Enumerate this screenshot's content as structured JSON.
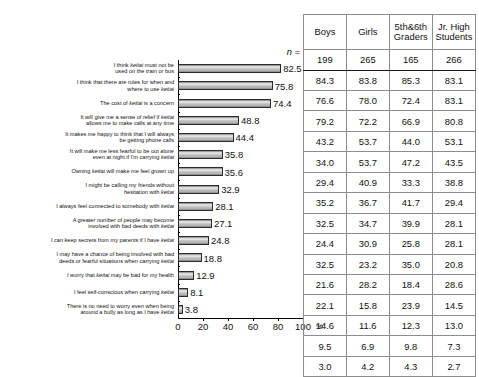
{
  "chart_data": {
    "type": "bar",
    "title": "",
    "xlabel": "",
    "ylabel": "",
    "unit": "%",
    "xlim": [
      0,
      100
    ],
    "xticks": [
      0,
      20,
      40,
      60,
      80,
      100
    ],
    "grid": false,
    "orientation": "horizontal",
    "categories": [
      "I think keitai must not be\nused on the train or bus",
      "I think that there are rules for when and\nwhere to use keitai",
      "The cost of keitai is a concern",
      "It will give me a sense of relief if keitai\nallows me to make calls at any time",
      "It makes me happy to think that I will always\nbe getting phone calls",
      "It will make me less fearful to be out alone\neven at night if  I'm carrying keitai",
      "Owning keitai will make me feel grown up",
      "I might be calling my friends without\nhesitation with keitai",
      "I always feel connected to somebody with keitai",
      "A greater number of people may become\ninvolved with bad deeds with keitai",
      "I can keep secrets from my parents if I have keitai",
      "I may have a chance of being involved with bad\ndeeds or fearful situations when carrying keitai",
      "I worry that keitai may be bad for my health",
      "I feel self-conscious when carrying keitai",
      "There is no need to worry even when being\naround a bully as long as I have keitai"
    ],
    "values": [
      82.5,
      75.8,
      74.4,
      48.8,
      44.4,
      35.8,
      35.6,
      32.9,
      28.1,
      27.1,
      24.8,
      18.8,
      12.9,
      8.1,
      3.8
    ],
    "value_labels": [
      "82.5",
      "75.8",
      "74.4",
      "48.8",
      "44.4",
      "35.8",
      "35.6",
      "32.9",
      "28.1",
      "27.1",
      "24.8",
      "18.8",
      "12.9",
      "8.1",
      "3.8"
    ],
    "tick_labels": [
      "0",
      "20",
      "40",
      "60",
      "80",
      "100"
    ]
  },
  "table": {
    "n_label": "n =",
    "columns": [
      "Boys",
      "Girls",
      "5th&6th Graders",
      "Jr. High Students"
    ],
    "columns_wrapped": [
      [
        "Boys",
        ""
      ],
      [
        "Girls",
        ""
      ],
      [
        "5th&6th",
        "Graders"
      ],
      [
        "Jr. High",
        "Students"
      ]
    ],
    "n_values": [
      "199",
      "265",
      "165",
      "266"
    ],
    "rows": [
      [
        "84.3",
        "83.8",
        "85.3",
        "83.1"
      ],
      [
        "76.6",
        "78.0",
        "72.4",
        "83.1"
      ],
      [
        "79.2",
        "72.2",
        "66.9",
        "80.8"
      ],
      [
        "43.2",
        "53.7",
        "44.0",
        "53.1"
      ],
      [
        "34.0",
        "53.7",
        "47.2",
        "43.5"
      ],
      [
        "29.4",
        "40.9",
        "33.3",
        "38.8"
      ],
      [
        "35.2",
        "36.7",
        "41.7",
        "29.4"
      ],
      [
        "32.5",
        "34.7",
        "39.9",
        "28.1"
      ],
      [
        "24.4",
        "30.9",
        "25.8",
        "28.1"
      ],
      [
        "32.5",
        "23.2",
        "35.0",
        "20.8"
      ],
      [
        "21.6",
        "28.2",
        "18.4",
        "28.6"
      ],
      [
        "22.1",
        "15.8",
        "23.9",
        "14.5"
      ],
      [
        "14.6",
        "11.6",
        "12.3",
        "13.0"
      ],
      [
        "9.5",
        "6.9",
        "9.8",
        "7.3"
      ],
      [
        "3.0",
        "4.2",
        "4.3",
        "2.7"
      ]
    ]
  },
  "colors": {
    "bar_fill": "#c3c3c3",
    "bar_stroke": "#2b2b2b",
    "axis": "#000000",
    "table_border": "#8d8d8d",
    "text": "#111111"
  }
}
